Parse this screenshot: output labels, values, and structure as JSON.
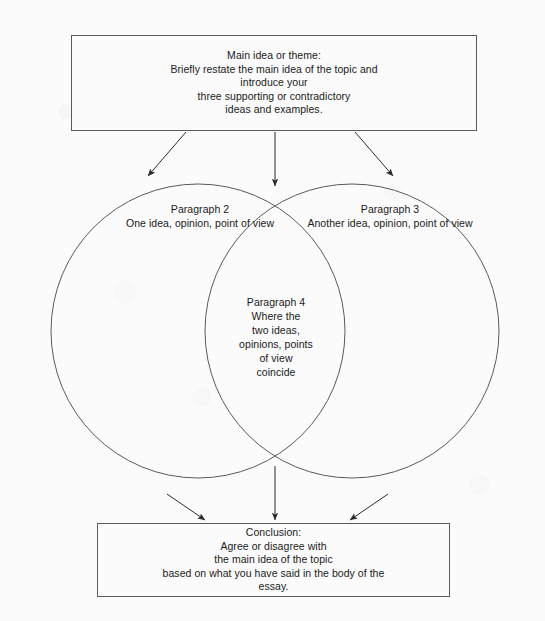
{
  "diagram": {
    "background_color": "#fbfbfb",
    "stroke_color": "#5a5a5a",
    "text_color": "#1a1a1a",
    "intro_box": {
      "text": "Main idea or theme:\nBriefly restate the main idea of the topic and\nintroduce your\nthree supporting or contradictory\nideas and examples."
    },
    "conclusion_box": {
      "text": "Conclusion:\nAgree or disagree with\nthe main idea of the topic\nbased on what you have said in the body of the\nessay."
    },
    "left_circle": {
      "label": "Paragraph 2\nOne idea, opinion, point of view"
    },
    "right_circle": {
      "label": "Paragraph 3\nAnother idea, opinion, point of view"
    },
    "intersection": {
      "label": "Paragraph 4\nWhere the\ntwo ideas,\nopinions, points\nof view\ncoincide"
    },
    "arrows": {
      "top_left": "arrow-down-left",
      "top_center": "arrow-down",
      "top_right": "arrow-down-right",
      "bottom_left": "arrow-down-right",
      "bottom_center": "arrow-down",
      "bottom_right": "arrow-down-left"
    }
  }
}
